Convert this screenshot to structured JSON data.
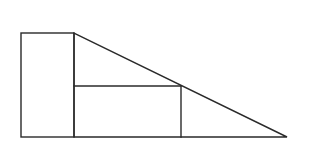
{
  "diagram": {
    "stroke_color": "#2a2a2a",
    "background": "#ffffff",
    "shapes": {
      "left_rectangle": {
        "x1": 21,
        "y1": 33,
        "x2": 74,
        "y2": 137
      },
      "triangle": {
        "points": [
          [
            74,
            33
          ],
          [
            74,
            137
          ],
          [
            287,
            137
          ]
        ]
      },
      "inscribed_rectangle": {
        "x1": 74,
        "y1": 86,
        "x2": 181,
        "y2": 137
      }
    },
    "labels": []
  }
}
